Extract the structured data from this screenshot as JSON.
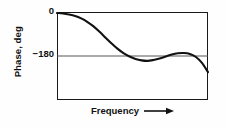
{
  "figure": {
    "background_color": "#fefefe",
    "frame_color": "#1a1a1a",
    "curve_color": "#111111",
    "gridline_color": "#555555"
  },
  "axes": {
    "ylabel": "Phase, deg",
    "xlabel": "Frequency",
    "xlabel_arrow": "arrow-right-icon",
    "yticks": [
      {
        "label": "0",
        "value": 0
      },
      {
        "label": "−180",
        "value": -180
      }
    ]
  },
  "chart_data": {
    "type": "line",
    "title": "",
    "subtitle": "",
    "xlabel": "Frequency",
    "ylabel": "Phase, deg",
    "grid": false,
    "legend": false,
    "legend_position": "none",
    "xlim": [
      0,
      100
    ],
    "ylim": [
      -360,
      0
    ],
    "xticks": [],
    "xtick_labels": [],
    "yticks": [
      0,
      -180
    ],
    "ytick_labels": [
      "0",
      "−180"
    ],
    "annotations": [
      {
        "text": "−180 reference line",
        "type": "horizontal-line",
        "y": -180
      }
    ],
    "series": [
      {
        "name": "Phase",
        "x": [
          0,
          4,
          8,
          12,
          16,
          20,
          24,
          28,
          32,
          36,
          40,
          44,
          48,
          52,
          56,
          60,
          64,
          68,
          72,
          76,
          80,
          84,
          88,
          92,
          96,
          100
        ],
        "values": [
          -4,
          -6,
          -10,
          -16,
          -26,
          -40,
          -58,
          -80,
          -104,
          -128,
          -150,
          -168,
          -182,
          -192,
          -198,
          -200,
          -196,
          -190,
          -182,
          -174,
          -169,
          -168,
          -172,
          -184,
          -208,
          -246
        ]
      }
    ]
  }
}
